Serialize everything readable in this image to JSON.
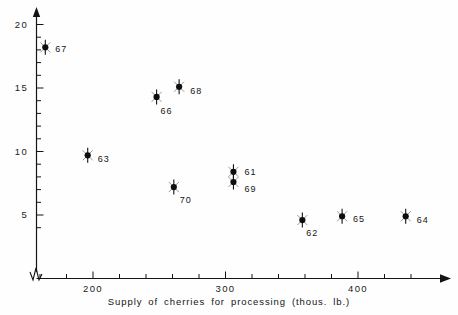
{
  "chart_data": {
    "type": "scatter",
    "title": "",
    "xlabel": "Supply of cherries for processing (thous. lb.)",
    "ylabel": "",
    "xlim": [
      150,
      460
    ],
    "ylim": [
      3.0,
      21.0
    ],
    "grid": false,
    "legend": "none",
    "axis_break": {
      "x": true,
      "y": true,
      "symbol": "zigzag"
    },
    "xticks_major": [
      200,
      300,
      400
    ],
    "xticks_major_labels": [
      "200",
      "300",
      "400"
    ],
    "xticks_minor_step": 20,
    "yticks_major": [
      5,
      10,
      15,
      20
    ],
    "yticks_major_labels": [
      "5",
      "10",
      "15",
      "20"
    ],
    "yticks_minor_step": 1,
    "marker_style": "filled-dot-with-vertical-bar",
    "point_label_field": "year",
    "points": [
      {
        "year": "67",
        "x": 164,
        "y": 18.2,
        "label_dx": 10,
        "label_dy": 2
      },
      {
        "year": "63",
        "x": 196,
        "y": 9.7,
        "label_dx": 10,
        "label_dy": 4
      },
      {
        "year": "66",
        "x": 248,
        "y": 14.3,
        "label_dx": 4,
        "label_dy": 14
      },
      {
        "year": "68",
        "x": 265,
        "y": 15.1,
        "label_dx": 11,
        "label_dy": 4
      },
      {
        "year": "70",
        "x": 261,
        "y": 7.2,
        "label_dx": 6,
        "label_dy": 13
      },
      {
        "year": "61",
        "x": 306,
        "y": 8.4,
        "label_dx": 11,
        "label_dy": 0
      },
      {
        "year": "69",
        "x": 306,
        "y": 7.6,
        "label_dx": 11,
        "label_dy": 7
      },
      {
        "year": "62",
        "x": 358,
        "y": 4.6,
        "label_dx": 4,
        "label_dy": 13
      },
      {
        "year": "65",
        "x": 388,
        "y": 4.9,
        "label_dx": 11,
        "label_dy": 3
      },
      {
        "year": "64",
        "x": 436,
        "y": 4.9,
        "label_dx": 11,
        "label_dy": 4
      }
    ]
  },
  "style": {
    "background_color": "#fefefe",
    "axis_color": "#141414",
    "marker_color": "#0d0d0d",
    "text_color": "#141414"
  },
  "icons": {
    "x_axis_arrow": "arrow-right-icon",
    "y_axis_arrow": "arrow-up-icon",
    "break_symbol": "axis-break-zigzag-icon"
  }
}
